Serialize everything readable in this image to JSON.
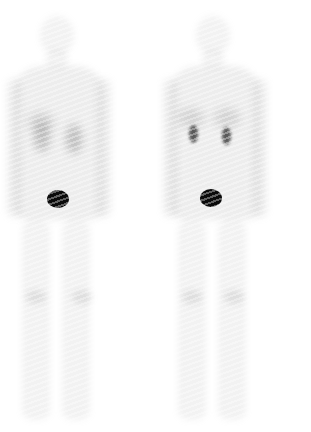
{
  "image": {
    "description": "Whole-body nuclear scintigraphy, two views side by side",
    "background_color": "#ffffff",
    "views": [
      {
        "id": "left-view",
        "findings": {
          "kidneys": "diffuse faint uptake",
          "bladder": "intense focal uptake"
        },
        "tracer_color": "#0a0a0a"
      },
      {
        "id": "right-view",
        "findings": {
          "kidneys": "focal intense cortical uptake",
          "bladder": "intense focal uptake"
        },
        "tracer_color": "#0a0a0a"
      }
    ]
  }
}
